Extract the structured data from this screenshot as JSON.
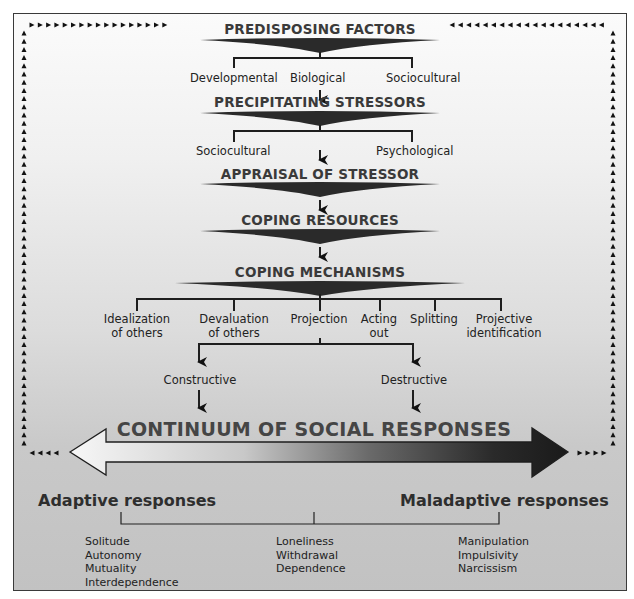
{
  "diagram": {
    "stages": [
      {
        "title": "PREDISPOSING FACTORS",
        "children": [
          "Developmental",
          "Biological",
          "Sociocultural"
        ]
      },
      {
        "title": "PRECIPITATING STRESSORS",
        "children": [
          "Sociocultural",
          "Psychological"
        ]
      },
      {
        "title": "APPRAISAL OF STRESSOR"
      },
      {
        "title": "COPING RESOURCES"
      },
      {
        "title": "COPING MECHANISMS",
        "children": [
          {
            "line1": "Idealization",
            "line2": "of others"
          },
          {
            "line1": "Devaluation",
            "line2": "of others"
          },
          {
            "line1": "Projection",
            "line2": ""
          },
          {
            "line1": "Acting",
            "line2": "out"
          },
          {
            "line1": "Splitting",
            "line2": ""
          },
          {
            "line1": "Projective",
            "line2": "identification"
          }
        ]
      }
    ],
    "outcomes": [
      "Constructive",
      "Destructive"
    ],
    "continuum": {
      "title": "CONTINUUM OF SOCIAL RESPONSES",
      "left_label": "Adaptive responses",
      "right_label": "Maladaptive responses",
      "left_color": "#f5f5f5",
      "right_color": "#1e1e1e"
    },
    "responses": {
      "adaptive": [
        "Solitude",
        "Autonomy",
        "Mutuality",
        "Interdependence"
      ],
      "middle": [
        "Loneliness",
        "Withdrawal",
        "Dependence"
      ],
      "maladaptive": [
        "Manipulation",
        "Impulsivity",
        "Narcissism"
      ]
    },
    "feedback_icon": "dotted-triangle-arrow-loop"
  }
}
